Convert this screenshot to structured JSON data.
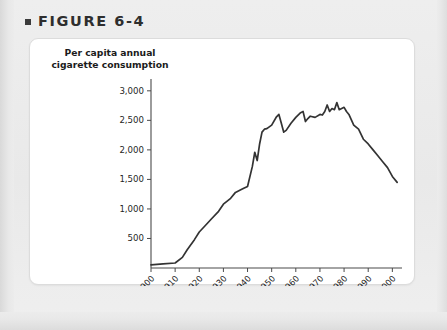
{
  "figure": {
    "bullet_icon": "square-bullet-icon",
    "label": "FIGURE 6-4"
  },
  "card": {
    "axis_title_line1": "Per capita annual",
    "axis_title_line2": "cigarette consumption"
  },
  "chart_data": {
    "type": "line",
    "title": "FIGURE 6-4",
    "xlabel": "",
    "ylabel": "Per capita annual cigarette consumption",
    "xlim": [
      1900,
      2004
    ],
    "ylim": [
      0,
      3200
    ],
    "grid": false,
    "legend": null,
    "xticks": [
      "1900",
      "1910",
      "1920",
      "1930",
      "1940",
      "1950",
      "1960",
      "1970",
      "1980",
      "1990",
      "2000"
    ],
    "xtick_values": [
      1900,
      1910,
      1920,
      1930,
      1940,
      1950,
      1960,
      1970,
      1980,
      1990,
      2000
    ],
    "yticks": [
      "500",
      "1,000",
      "1,500",
      "2,000",
      "2,500",
      "3,000"
    ],
    "ytick_values": [
      500,
      1000,
      1500,
      2000,
      2500,
      3000
    ],
    "series": [
      {
        "name": "Per capita annual cigarette consumption",
        "color": "#333333",
        "x": [
          1900,
          1905,
          1910,
          1913,
          1915,
          1918,
          1920,
          1923,
          1925,
          1928,
          1930,
          1933,
          1935,
          1938,
          1940,
          1942,
          1943,
          1944,
          1945,
          1946,
          1947,
          1948,
          1950,
          1952,
          1953,
          1954,
          1955,
          1956,
          1958,
          1960,
          1962,
          1963,
          1964,
          1965,
          1966,
          1968,
          1970,
          1971,
          1972,
          1973,
          1974,
          1975,
          1976,
          1977,
          1978,
          1979,
          1980,
          1981,
          1982,
          1984,
          1986,
          1988,
          1990,
          1992,
          1994,
          1996,
          1998,
          2000,
          2002
        ],
        "y": [
          54,
          70,
          85,
          180,
          310,
          480,
          610,
          740,
          830,
          960,
          1080,
          1180,
          1280,
          1340,
          1380,
          1720,
          1960,
          1820,
          2100,
          2300,
          2350,
          2360,
          2420,
          2560,
          2600,
          2450,
          2300,
          2330,
          2450,
          2550,
          2630,
          2650,
          2480,
          2530,
          2570,
          2550,
          2600,
          2590,
          2650,
          2760,
          2650,
          2700,
          2680,
          2800,
          2680,
          2700,
          2720,
          2650,
          2600,
          2420,
          2350,
          2180,
          2100,
          2000,
          1900,
          1800,
          1700,
          1550,
          1450
        ]
      }
    ]
  }
}
